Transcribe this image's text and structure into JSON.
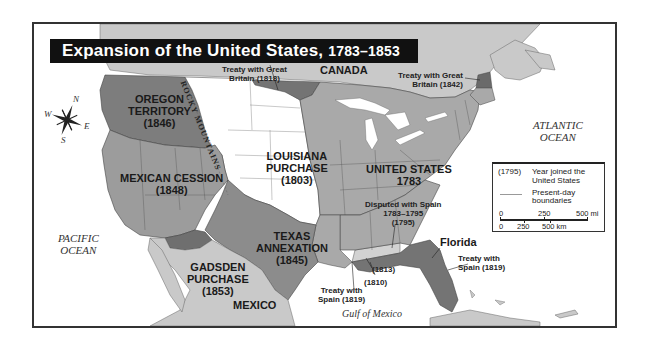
{
  "title": {
    "main": "Expansion of the United States, ",
    "years": "1783–1853"
  },
  "regions": {
    "oregon": {
      "name": "OREGON",
      "name2": "TERRITORY",
      "year": "(1846)"
    },
    "mexican_cession": {
      "name": "MEXICAN CESSION",
      "year": "(1848)"
    },
    "louisiana": {
      "name": "LOUISIANA",
      "name2": "PURCHASE",
      "year": "(1803)"
    },
    "united_states": {
      "name": "UNITED STATES",
      "year": "1783"
    },
    "texas": {
      "name": "TEXAS",
      "name2": "ANNEXATION",
      "year": "(1845)"
    },
    "gadsden": {
      "name": "GADSDEN",
      "name2": "PURCHASE",
      "year": "(1853)"
    },
    "florida": {
      "name": "Florida"
    },
    "canada": {
      "name": "CANADA"
    },
    "mexico": {
      "name": "MEXICO"
    }
  },
  "annotations": {
    "treaty_1818": {
      "line1": "Treaty with Great",
      "line2": "Britain (1818)"
    },
    "treaty_1842": {
      "line1": "Treaty with Great",
      "line2": "Britain (1842)"
    },
    "disputed_spain": {
      "line1": "Disputed with Spain",
      "line2": "1783–1795",
      "line3": "(1795)"
    },
    "treaty_spain_florida": {
      "line1": "Treaty with",
      "line2": "Spain (1819)"
    },
    "treaty_spain_texas": {
      "line1": "Treaty with",
      "line2": "Spain (1819)"
    },
    "year_1813": "(1813)",
    "year_1810": "(1810)",
    "rocky_mountains": "ROCKY MOUNTAINS"
  },
  "water": {
    "pacific": {
      "line1": "PACIFIC",
      "line2": "OCEAN"
    },
    "atlantic": {
      "line1": "ATLANTIC",
      "line2": "OCEAN"
    },
    "gulf": "Gulf of Mexico"
  },
  "compass": {
    "n": "N",
    "s": "S",
    "e": "E",
    "w": "W"
  },
  "legend": {
    "year_key": "(1795)",
    "year_desc": "Year joined the United States",
    "boundary_desc": "Present-day boundaries",
    "scale_mi": {
      "zero": "0",
      "mid": "250",
      "end": "500 mi"
    },
    "scale_km": {
      "zero": "0",
      "mid": "250",
      "end": "500 km"
    }
  },
  "colors": {
    "title_bg": "#111111",
    "oregon": "#7d7d7d",
    "mexican_cession": "#9c9c9c",
    "louisiana": "#ffffff",
    "us_1783": "#a9a9a9",
    "texas": "#8c8c8c",
    "gadsden": "#6f6f6f",
    "florida": "#747474",
    "treaty_1818": "#747474",
    "disputed_spain": "#d2d2d2",
    "foreign_land": "#c9c9c9",
    "water": "#ffffff"
  }
}
